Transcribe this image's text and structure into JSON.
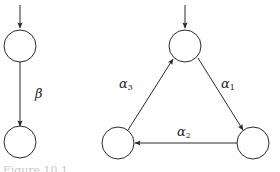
{
  "figure": {
    "background_color": "#fefefe",
    "stroke_color": "#2b2b2b",
    "text_color": "#1d1d1d",
    "caption_fragment": "Figure 10.1"
  },
  "left_graph": {
    "name": "two-state-chain",
    "nodes": [
      {
        "id": "L1",
        "label": "",
        "cx": 20,
        "cy": 46,
        "r": 16
      },
      {
        "id": "L2",
        "label": "",
        "cx": 20,
        "cy": 142,
        "r": 16
      }
    ],
    "entry_arrow": {
      "from_x": 20,
      "from_y": 5,
      "to_x": 20,
      "to_y": 28
    },
    "edges": [
      {
        "id": "beta-edge",
        "from": "L1",
        "to": "L2",
        "label": "β",
        "label_sub": "",
        "x1": 20,
        "y1": 62,
        "x2": 20,
        "y2": 126
      }
    ]
  },
  "right_graph": {
    "name": "three-state-cycle",
    "nodes": [
      {
        "id": "T",
        "label": "",
        "cx": 185,
        "cy": 46,
        "r": 16
      },
      {
        "id": "BL",
        "label": "",
        "cx": 118,
        "cy": 143,
        "r": 16
      },
      {
        "id": "BR",
        "label": "",
        "cx": 253,
        "cy": 143,
        "r": 16
      }
    ],
    "entry_arrow": {
      "from_x": 185,
      "from_y": 5,
      "to_x": 185,
      "to_y": 28
    },
    "edges": [
      {
        "id": "alpha1-edge",
        "from": "T",
        "to": "BR",
        "label": "α",
        "label_sub": "1",
        "x1": 198,
        "y1": 58,
        "x2": 243,
        "y2": 130
      },
      {
        "id": "alpha2-edge",
        "from": "BR",
        "to": "BL",
        "label": "α",
        "label_sub": "2",
        "x1": 237,
        "y1": 143,
        "x2": 135,
        "y2": 143
      },
      {
        "id": "alpha3-edge",
        "from": "BL",
        "to": "T",
        "label": "α",
        "label_sub": "3",
        "x1": 128,
        "y1": 130,
        "x2": 173,
        "y2": 59
      }
    ]
  }
}
